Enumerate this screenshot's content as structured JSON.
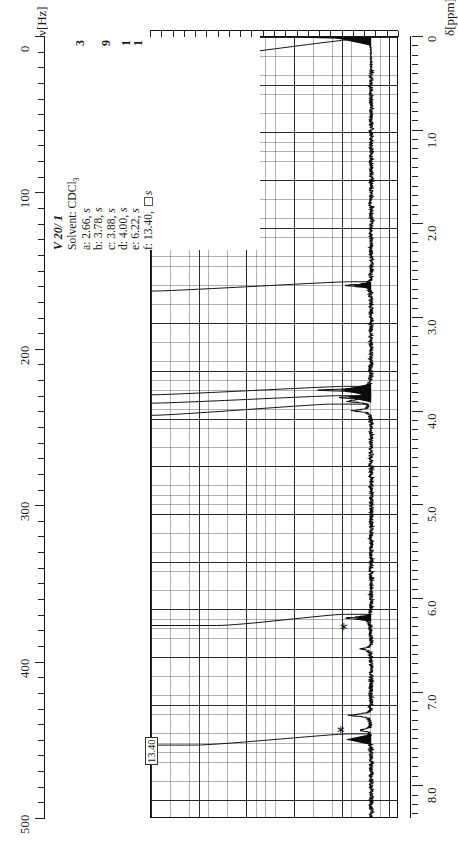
{
  "figure": {
    "kind": "nmr-spectrum",
    "title": "V 20/ 1",
    "solvent_line": "Solvent: CDCl",
    "solvent_sub": "3"
  },
  "axes": {
    "left": {
      "caption": "ν[Hz]",
      "ticks": [
        "0",
        "100",
        "200",
        "300",
        "400",
        "500"
      ],
      "min": 0,
      "max": 500
    },
    "bottom": {
      "caption": "δ[ppm]",
      "ticks": [
        "0",
        "1.0",
        "2.0",
        "3.0",
        "4.0",
        "5.0",
        "6.0",
        "7.0",
        "8.0"
      ],
      "min": 0,
      "max": 8.0
    }
  },
  "integrals": {
    "values": [
      "3",
      "9",
      "1",
      "1"
    ]
  },
  "assignments": [
    {
      "key": "a:",
      "shift": "2.66",
      "mult": "s"
    },
    {
      "key": "b:",
      "shift": "3.78",
      "mult": "s"
    },
    {
      "key": "c:",
      "shift": "3.88",
      "mult": "s"
    },
    {
      "key": "d:",
      "shift": "4.00",
      "mult": "s"
    },
    {
      "key": "e:",
      "shift": "6.22",
      "mult": "s"
    },
    {
      "key": "f:",
      "shift": "13.40",
      "mult": "s"
    }
  ],
  "callouts": {
    "offscale_peak": "13.40",
    "star_marker": "*"
  },
  "chart_data": {
    "type": "line",
    "title": "V 20/ 1",
    "xlabel": "δ[ppm]",
    "ylabel": "ν[Hz]",
    "xlim": [
      0,
      8.0
    ],
    "ylim_hz": [
      0,
      500
    ],
    "grid": true,
    "legend": "none",
    "peaks_ppm": [
      0.0,
      2.66,
      3.78,
      3.88,
      4.0,
      6.22,
      7.26,
      13.4
    ],
    "peak_labels": [
      "TMS",
      "a",
      "b",
      "c",
      "d",
      "e",
      "*",
      "f"
    ],
    "peak_integrals": [
      null,
      "3",
      "9",
      "9",
      "9",
      "1",
      null,
      "1"
    ],
    "peak_rel_heights": [
      1.0,
      0.3,
      0.95,
      0.7,
      0.55,
      0.45,
      0.2,
      0.4
    ],
    "solvent_markers_ppm": [
      6.55,
      7.4
    ]
  }
}
